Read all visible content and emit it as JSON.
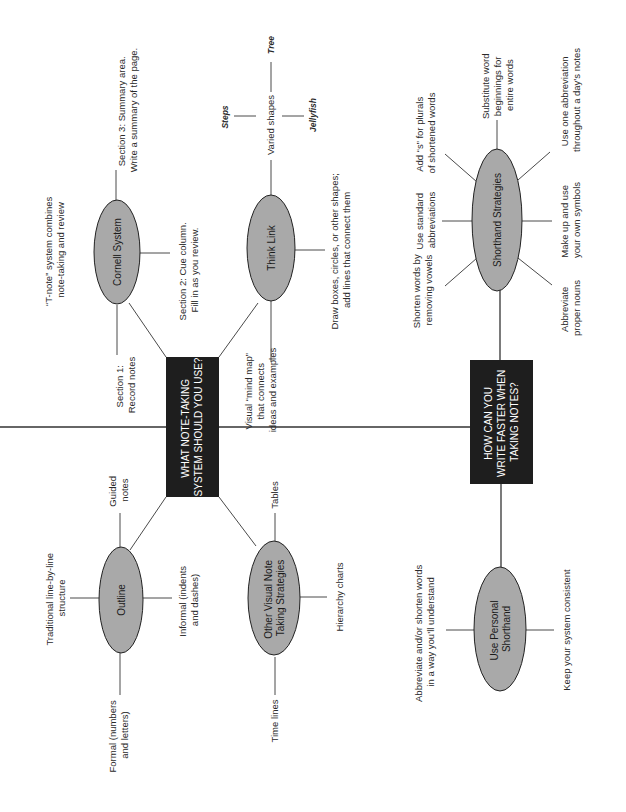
{
  "diagram": {
    "orientation": "rotated 90deg counter-clockwise (text reads bottom-to-top)",
    "colors": {
      "hub_fill": "#1e1e1e",
      "hub_text": "#ffffff",
      "node_fill": "#a9a9a9",
      "line": "#4a4a4a",
      "background": "#ffffff"
    },
    "hubs": [
      {
        "id": "hub1",
        "lines": [
          "WHAT NOTE-TAKING",
          "SYSTEM SHOULD YOU USE?"
        ]
      },
      {
        "id": "hub2",
        "lines": [
          "HOW CAN YOU",
          "WRITE FASTER WHEN",
          "TAKING NOTES?"
        ]
      }
    ],
    "nodes": {
      "cornell": {
        "label": [
          "Cornell System"
        ],
        "details": {
          "tnote": [
            "“T-note” system combines",
            "note-taking and review"
          ],
          "section1": [
            "Section 1:",
            "Record notes"
          ],
          "section2": [
            "Section 2: Cue column.",
            "Fill in as you review."
          ],
          "section3": [
            "Section 3: Summary area.",
            "Write a summary of the page."
          ]
        }
      },
      "thinklink": {
        "label": [
          "Think Link"
        ],
        "details": {
          "mindmap": [
            "Visual “mind map”",
            "that connects",
            "ideas and examples"
          ],
          "draw": [
            "Draw boxes, circles, or other shapes;",
            "add lines that connect them"
          ],
          "varied": [
            "Varied shapes"
          ],
          "steps": "Steps",
          "tree": "Tree",
          "jellyfish": "Jellyfish"
        }
      },
      "outline": {
        "label": [
          "Outline"
        ],
        "details": {
          "traditional": [
            "Traditional line-by-line",
            "structure"
          ],
          "guided": [
            "Guided",
            "notes"
          ],
          "informal": [
            "Informal (indents",
            "and dashes)"
          ],
          "formal": [
            "Formal (numbers",
            "and letters)"
          ]
        }
      },
      "othervisual": {
        "label": [
          "Other Visual Note",
          "Taking Strategies"
        ],
        "details": {
          "tables": [
            "Tables"
          ],
          "hierarchy": [
            "Hierarchy charts"
          ],
          "timelines": [
            "Time lines"
          ]
        }
      },
      "shorthand": {
        "label": [
          "Shorthand Strategies"
        ],
        "details": {
          "vowels": [
            "Shorten words by",
            "removing vowels"
          ],
          "standard": [
            "Use standard",
            "abbreviations"
          ],
          "plurals": [
            "Add “s” for plurals",
            "of shortened words"
          ],
          "substitute": [
            "Substitute word",
            "beginnings for",
            "entire words"
          ],
          "oneabbr": [
            "Use one abbreviation",
            "throughout a day’s notes"
          ],
          "symbols": [
            "Make up and use",
            "your own symbols"
          ],
          "proper": [
            "Abbreviate",
            "proper nouns"
          ]
        }
      },
      "personal": {
        "label": [
          "Use Personal",
          "Shorthand"
        ],
        "details": {
          "abbreviate": [
            "Abbreviate and/or shorten words",
            "in a way you’ll understand"
          ],
          "consistent": [
            "Keep your system consistent"
          ]
        }
      }
    }
  }
}
